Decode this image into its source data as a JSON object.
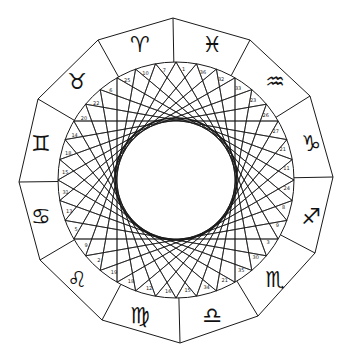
{
  "diagram": {
    "center": {
      "x": 176,
      "y": 180
    },
    "outer_polygon_vertices": [
      [
        173,
        18
      ],
      [
        250,
        40
      ],
      [
        310,
        96
      ],
      [
        333,
        177
      ],
      [
        315,
        253
      ],
      [
        258,
        316
      ],
      [
        180,
        343
      ],
      [
        102,
        320
      ],
      [
        40,
        260
      ],
      [
        19,
        182
      ],
      [
        38,
        99
      ],
      [
        98,
        40
      ]
    ],
    "ring_radius": 118,
    "inner_circle": {
      "cx": 176,
      "cy": 179,
      "r": 61
    },
    "chord_points": 36,
    "chord_step": 12,
    "chord_start_angle_deg": -90,
    "line_color": "#1a1a1a",
    "background": "#ffffff",
    "signs": [
      {
        "name": "Aries",
        "glyph": "♈",
        "angle_deg": -105
      },
      {
        "name": "Pisces",
        "glyph": "♓",
        "angle_deg": -75
      },
      {
        "name": "Aquarius",
        "glyph": "♒",
        "angle_deg": -45
      },
      {
        "name": "Capricorn",
        "glyph": "♑",
        "angle_deg": -15
      },
      {
        "name": "Sagittarius",
        "glyph": "♐",
        "angle_deg": 15
      },
      {
        "name": "Scorpio",
        "glyph": "♏",
        "angle_deg": 45
      },
      {
        "name": "Libra",
        "glyph": "♎",
        "angle_deg": 75
      },
      {
        "name": "Virgo",
        "glyph": "♍",
        "angle_deg": 105
      },
      {
        "name": "Leo",
        "glyph": "♌",
        "angle_deg": 135
      },
      {
        "name": "Cancer",
        "glyph": "♋",
        "angle_deg": 165
      },
      {
        "name": "Gemini",
        "glyph": "♊",
        "angle_deg": 195
      },
      {
        "name": "Taurus",
        "glyph": "♉",
        "angle_deg": 225
      }
    ],
    "division_labels": [
      "1",
      "36",
      "32",
      "33",
      "23",
      "26",
      "27",
      "21",
      "11",
      "24",
      "8",
      "9",
      "3",
      "30",
      "35",
      "21",
      "34",
      "15",
      "16",
      "12",
      "18",
      "19",
      "2",
      "9",
      "5",
      "13",
      "31",
      "15",
      "18",
      "14",
      "20",
      "22",
      "6",
      "25",
      "10",
      "7"
    ]
  }
}
